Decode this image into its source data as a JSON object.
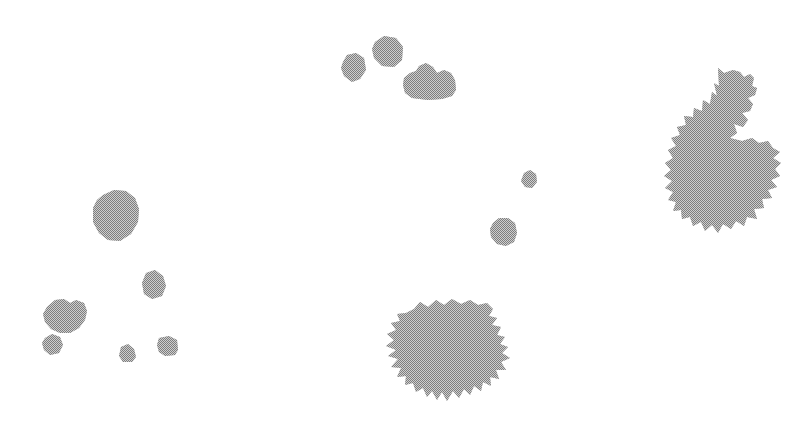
{
  "figure": {
    "width": 809,
    "height": 446,
    "background_color": "#ffffff",
    "title": "",
    "caption": "",
    "shape_fill_color": "#919191",
    "shape_texture": "halftone-dither",
    "shape_count": 14
  },
  "chart_data": {
    "type": "scatter",
    "title": "",
    "xlabel": "",
    "ylabel": "",
    "xlim": [
      0,
      809
    ],
    "ylim": [
      0,
      446
    ],
    "grid": false,
    "legend": "none",
    "categories": [
      "top-middle-small-a",
      "top-middle-small-b",
      "top-middle-slab",
      "right-large-blob",
      "mid-tiny-a",
      "mid-small-b",
      "left-octagon",
      "left-pentagon",
      "left-double-lobe",
      "left-tiny-lower",
      "left-tiny-bottom-a",
      "left-tiny-bottom-b",
      "bottom-center-large-blob"
    ],
    "values": [
      32,
      40,
      58,
      180,
      11,
      24,
      52,
      22,
      40,
      18,
      14,
      18,
      120
    ],
    "points": [
      {
        "label": "top-middle-small-a",
        "x": 354,
        "y": 68,
        "size": 32
      },
      {
        "label": "top-middle-small-b",
        "x": 386,
        "y": 51,
        "size": 40
      },
      {
        "label": "top-middle-slab",
        "x": 428,
        "y": 84,
        "size": 58
      },
      {
        "label": "right-large-blob",
        "x": 722,
        "y": 155,
        "size": 180
      },
      {
        "label": "mid-tiny-a",
        "x": 530,
        "y": 180,
        "size": 11
      },
      {
        "label": "mid-small-b",
        "x": 505,
        "y": 232,
        "size": 24
      },
      {
        "label": "left-octagon",
        "x": 114,
        "y": 217,
        "size": 52
      },
      {
        "label": "left-pentagon",
        "x": 154,
        "y": 285,
        "size": 22
      },
      {
        "label": "left-double-lobe",
        "x": 60,
        "y": 316,
        "size": 40
      },
      {
        "label": "left-tiny-lower",
        "x": 52,
        "y": 344,
        "size": 18
      },
      {
        "label": "left-tiny-bottom-a",
        "x": 127,
        "y": 353,
        "size": 14
      },
      {
        "label": "left-tiny-bottom-b",
        "x": 168,
        "y": 346,
        "size": 18
      },
      {
        "label": "bottom-center-large-blob",
        "x": 455,
        "y": 350,
        "size": 120
      }
    ]
  },
  "shapes": [
    {
      "name": "top-middle-small-a",
      "points": "343,62 347,55 356,53 364,58 366,70 360,79 352,82 344,76 341,68"
    },
    {
      "name": "top-middle-small-b",
      "points": "375,42 384,36 396,38 403,47 402,60 394,67 382,66 374,58 372,49"
    },
    {
      "name": "top-middle-slab",
      "points": "403,85 404,78 410,73 416,71 419,66 426,63 433,67 437,73 444,70 451,73 455,80 456,90 452,96 442,99 428,100 412,98 405,93"
    },
    {
      "name": "right-large-blob",
      "points": "718,68 724,73 733,70 740,72 744,77 750,74 754,78 752,86 757,88 755,95 748,98 753,104 750,111 742,113 748,120 743,127 734,124 737,133 730,138 742,141 752,138 759,143 768,141 773,148 780,152 773,158 781,163 775,169 780,176 771,180 777,187 768,190 772,198 762,199 764,208 754,209 757,219 747,217 744,226 736,221 731,229 723,224 718,233 712,225 705,231 701,222 693,226 690,217 682,219 681,210 673,211 676,202 668,200 673,192 665,188 672,181 664,176 671,170 665,163 673,158 668,150 676,146 671,138 680,135 677,127 686,125 684,116 693,117 694,108 702,111 703,100 710,104 712,92 717,96 714,83 719,86"
    },
    {
      "name": "mid-tiny-a",
      "points": "524,173 530,170 536,174 537,182 532,188 525,187 521,181"
    },
    {
      "name": "mid-small-b",
      "points": "493,223 499,218 508,218 515,223 517,233 514,242 506,246 497,244 491,237 490,229"
    },
    {
      "name": "left-octagon",
      "points": "103,195 114,190 126,191 135,198 139,209 138,222 131,234 120,241 108,240 99,233 93,222 93,208 97,200"
    },
    {
      "name": "left-pentagon",
      "points": "146,273 155,270 163,276 166,286 162,296 152,299 144,294 142,283"
    },
    {
      "name": "left-double-lobe",
      "points": "47,307 55,300 64,299 70,303 76,300 84,303 87,311 85,320 79,328 70,333 60,333 51,329 45,322 43,314"
    },
    {
      "name": "left-tiny-lower",
      "points": "45,338 52,334 60,337 63,345 59,353 50,355 44,350 42,343"
    },
    {
      "name": "left-tiny-bottom-a",
      "points": "121,347 128,344 134,349 136,357 132,362 123,362 119,356"
    },
    {
      "name": "left-tiny-bottom-b",
      "points": "159,338 169,336 177,340 178,350 175,355 165,356 159,352 157,345"
    },
    {
      "name": "bottom-center-large-blob",
      "points": "414,309 420,302 428,307 436,300 444,305 452,299 461,304 470,300 478,305 487,303 493,309 489,316 497,318 492,325 501,327 497,335 505,337 500,344 508,347 502,353 510,358 501,362 506,370 496,370 499,379 490,377 491,386 483,382 481,391 474,386 470,395 464,389 459,398 453,391 447,401 442,392 437,400 432,391 427,397 423,388 416,392 413,383 405,385 406,376 397,377 401,368 391,367 398,359 388,356 396,350 386,346 394,340 387,334 396,330 391,323 400,321 397,314 406,313"
    }
  ]
}
